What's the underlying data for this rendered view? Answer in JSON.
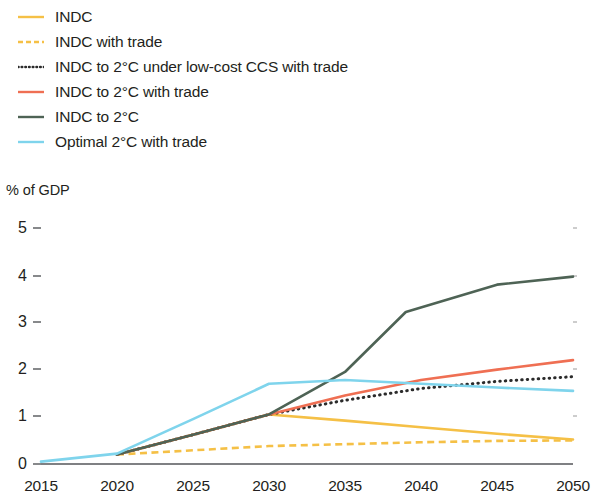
{
  "legend": {
    "position": "top-left",
    "items": [
      {
        "label": "INDC",
        "color": "#f5c046",
        "style": "solid",
        "name": "legend-item-indc"
      },
      {
        "label": "INDC with trade",
        "color": "#f5c046",
        "style": "dashed",
        "name": "legend-item-indc-with-trade"
      },
      {
        "label": "INDC to 2°C under low-cost CCS with trade",
        "color": "#2b2b2b",
        "style": "dotted",
        "name": "legend-item-indc-2c-lowcost-ccs-with-trade"
      },
      {
        "label": "INDC to 2°C with trade",
        "color": "#ef6f53",
        "style": "solid",
        "name": "legend-item-indc-2c-with-trade"
      },
      {
        "label": "INDC to 2°C",
        "color": "#4e6355",
        "style": "solid",
        "name": "legend-item-indc-2c"
      },
      {
        "label": "Optimal 2°C with trade",
        "color": "#7fd4ec",
        "style": "solid",
        "name": "legend-item-optimal-2c-with-trade"
      }
    ]
  },
  "axis_title": "% of GDP",
  "chart_data": {
    "type": "line",
    "title": "",
    "xlabel": "",
    "ylabel": "% of GDP",
    "xlim": [
      2015,
      2050
    ],
    "ylim": [
      0,
      5
    ],
    "grid": false,
    "legend_position": "top-left",
    "x": [
      2015,
      2020,
      2025,
      2030,
      2035,
      2040,
      2045,
      2050
    ],
    "xtick_labels": [
      "2015",
      "2020",
      "2025",
      "2030",
      "2035",
      "2040",
      "2045",
      "2050"
    ],
    "ytick_labels": [
      "0",
      "1",
      "2",
      "3",
      "4",
      "5"
    ],
    "ytick_values": [
      0,
      1,
      2,
      3,
      4,
      5
    ],
    "series": [
      {
        "name": "INDC",
        "color": "#f5c046",
        "style": "solid",
        "x": [
          2020,
          2025,
          2030,
          2035,
          2040,
          2045,
          2050
        ],
        "values": [
          0.2,
          0.62,
          1.05,
          0.92,
          0.78,
          0.64,
          0.52
        ]
      },
      {
        "name": "INDC with trade",
        "color": "#f5c046",
        "style": "dashed",
        "x": [
          2020,
          2025,
          2030,
          2035,
          2040,
          2045,
          2050
        ],
        "values": [
          0.2,
          0.29,
          0.38,
          0.42,
          0.46,
          0.49,
          0.5
        ]
      },
      {
        "name": "INDC to 2°C under low-cost CCS with trade",
        "color": "#2b2b2b",
        "style": "dotted",
        "x": [
          2020,
          2025,
          2030,
          2035,
          2040,
          2045,
          2050
        ],
        "values": [
          0.2,
          0.62,
          1.05,
          1.35,
          1.6,
          1.75,
          1.85
        ]
      },
      {
        "name": "INDC to 2°C with trade",
        "color": "#ef6f53",
        "style": "solid",
        "x": [
          2020,
          2025,
          2030,
          2035,
          2040,
          2045,
          2050
        ],
        "values": [
          0.2,
          0.62,
          1.05,
          1.45,
          1.78,
          2.0,
          2.2
        ]
      },
      {
        "name": "INDC to 2°C",
        "color": "#4e6355",
        "style": "solid",
        "x": [
          2020,
          2025,
          2030,
          2035,
          2039,
          2045,
          2050
        ],
        "values": [
          0.2,
          0.62,
          1.05,
          1.95,
          3.22,
          3.8,
          3.97
        ]
      },
      {
        "name": "Optimal 2°C with trade",
        "color": "#7fd4ec",
        "style": "solid",
        "x": [
          2015,
          2020,
          2025,
          2030,
          2035,
          2040,
          2045,
          2050
        ],
        "values": [
          0.05,
          0.22,
          0.95,
          1.7,
          1.78,
          1.7,
          1.62,
          1.55
        ]
      }
    ]
  }
}
